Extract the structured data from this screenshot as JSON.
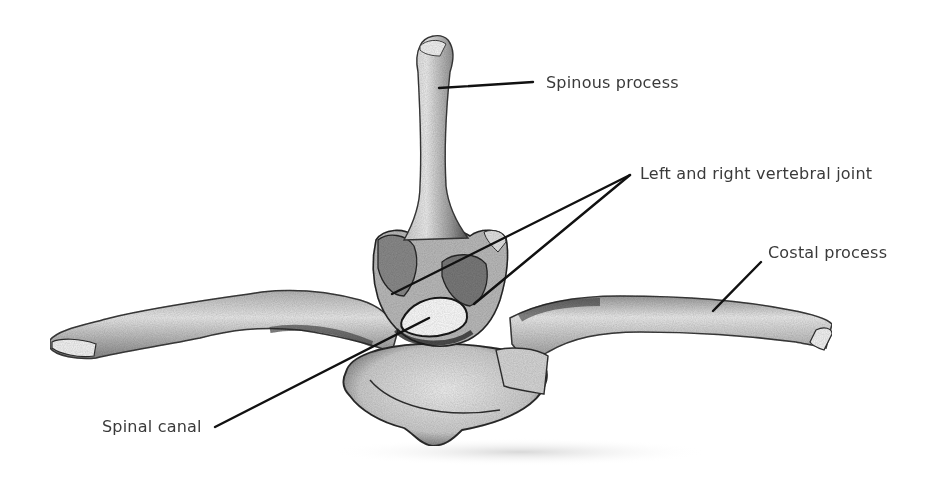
{
  "figure": {
    "background": "#ffffff",
    "label_color": "#3a3a3a",
    "line_color": "#111111",
    "labels": [
      {
        "id": "spinous",
        "text": "Spinous process",
        "x": 546,
        "y": 73
      },
      {
        "id": "joint",
        "text": "Left and right vertebral joint",
        "x": 640,
        "y": 164
      },
      {
        "id": "costal",
        "text": "Costal process",
        "x": 768,
        "y": 243
      },
      {
        "id": "canal",
        "text": "Spinal canal",
        "x": 102,
        "y": 417
      }
    ],
    "leaders": [
      {
        "for": "spinous",
        "x1": 533,
        "y1": 82,
        "x2": 439,
        "y2": 88
      },
      {
        "for": "joint",
        "x1": 630,
        "y1": 175,
        "x2": 392,
        "y2": 294
      },
      {
        "for": "joint",
        "x1": 630,
        "y1": 175,
        "x2": 474,
        "y2": 304
      },
      {
        "for": "costal",
        "x1": 761,
        "y1": 262,
        "x2": 713,
        "y2": 311
      },
      {
        "for": "canal",
        "x1": 215,
        "y1": 427,
        "x2": 429,
        "y2": 318
      }
    ]
  }
}
